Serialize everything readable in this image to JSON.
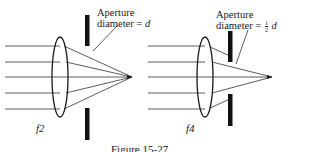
{
  "diagram": {
    "left": {
      "label_line1": "Aperture",
      "label_line2": "diameter = ",
      "label_var": "d",
      "fnumber": "f2"
    },
    "right": {
      "label_line1": "Aperture",
      "label_line2": "diameter = ",
      "fraction_num": "1",
      "fraction_den": "2",
      "label_var": "d",
      "fnumber": "f4"
    },
    "caption": "Figure 15-27"
  }
}
